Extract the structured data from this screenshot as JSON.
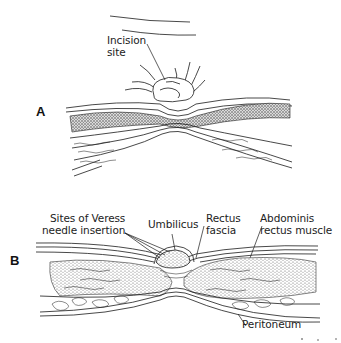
{
  "figure": {
    "panels": [
      {
        "letter": "A",
        "labels": {
          "incision_line1": "Incision",
          "incision_line2": "site"
        }
      },
      {
        "letter": "B",
        "labels": {
          "veress_line1": "Sites of Veress",
          "veress_line2": "needle insertion",
          "umbilicus": "Umbilicus",
          "rectus_fascia_line1": "Rectus",
          "rectus_fascia_line2": "fascia",
          "abdominis_line1": "Abdominis",
          "abdominis_line2": "rectus muscle",
          "peritoneum": "Peritoneum"
        }
      }
    ],
    "colors": {
      "ink": "#1a1a1a",
      "background": "#ffffff",
      "stipple": "#555555"
    }
  }
}
